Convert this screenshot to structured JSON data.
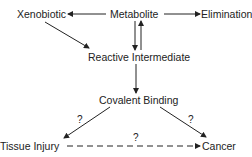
{
  "nodes": {
    "xenobiotic": "Xenobiotic",
    "metabolite": "Metabolite",
    "elimination": "Elimination",
    "reactive_intermediate": "Reactive Intermediate",
    "covalent_binding": "Covalent Binding",
    "tissue_injury": "Tissue Injury",
    "cancer": "Cancer"
  },
  "edge_labels": {
    "binding_to_injury": "?",
    "binding_to_cancer": "?",
    "injury_to_cancer": "?"
  },
  "colors": {
    "line": "#222222",
    "text": "#222222"
  }
}
